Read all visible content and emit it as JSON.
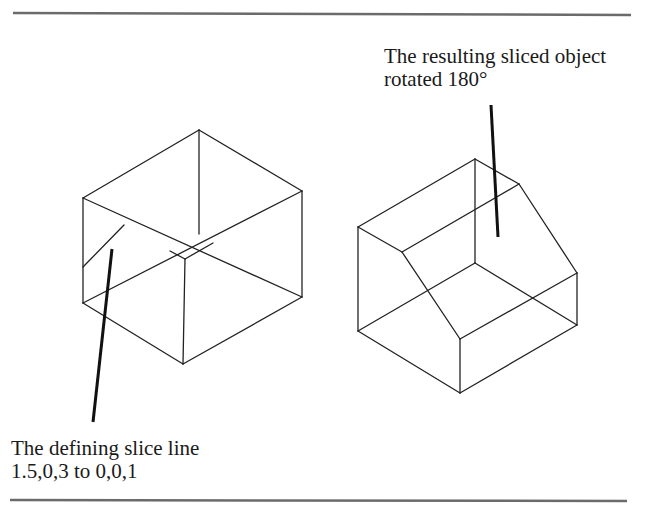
{
  "figure": {
    "annotations": {
      "right": {
        "line1": "The resulting sliced object",
        "line2": "rotated 180°"
      },
      "left": {
        "line1": "The defining slice line",
        "line2": "1.5,0,3 to 0,0,1"
      }
    },
    "objects": [
      {
        "id": "original-cube",
        "description": "Wireframe box with slice line on left face"
      },
      {
        "id": "sliced-object",
        "description": "Wireframe box with one edge sliced off, rotated 180 degrees"
      }
    ],
    "colors": {
      "lines": "#222222",
      "rules": "#6b6b6b",
      "background": "#ffffff"
    }
  }
}
